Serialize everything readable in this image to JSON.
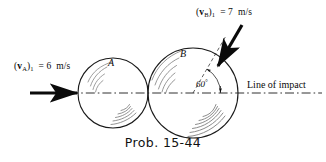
{
  "figure": {
    "caption": "Prob. 15-44",
    "line_of_impact_label": "Line of impact",
    "angle_label": "60",
    "angle_unit": "°",
    "ball_a": {
      "id": "A",
      "velocity_symbol": "v",
      "velocity_subscript_body": "A",
      "velocity_state": "1",
      "velocity_value": "6",
      "velocity_units": "m/s",
      "velocity_label": "(vA)1 = 6 m/s",
      "center_x": 113,
      "center_y": 93,
      "radius": 35
    },
    "ball_b": {
      "id": "B",
      "velocity_symbol": "v",
      "velocity_subscript_body": "B",
      "velocity_state": "1",
      "velocity_value": "7",
      "velocity_units": "m/s",
      "velocity_label": "(vB)1 = 7 m/s",
      "center_x": 193,
      "center_y": 93,
      "radius": 45,
      "incidence_angle_deg": 60
    },
    "colors": {
      "ink": "#0a0a0a",
      "outline": "#1a1a1a",
      "shading": "#8a8a8a",
      "background": "#ffffff"
    }
  }
}
